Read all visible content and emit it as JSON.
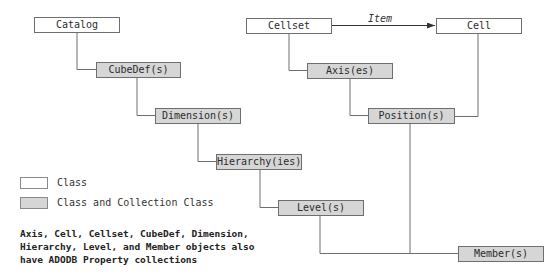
{
  "diagram": {
    "nodes": {
      "catalog": {
        "label": "Catalog",
        "kind": "class"
      },
      "cubedef": {
        "label": "CubeDef(s)",
        "kind": "collection"
      },
      "dimension": {
        "label": "Dimension(s)",
        "kind": "collection"
      },
      "hierarchy": {
        "label": "Hierarchy(ies)",
        "kind": "collection"
      },
      "level": {
        "label": "Level(s)",
        "kind": "collection"
      },
      "member": {
        "label": "Member(s)",
        "kind": "collection"
      },
      "cellset": {
        "label": "Cellset",
        "kind": "class"
      },
      "cell": {
        "label": "Cell",
        "kind": "class"
      },
      "axis": {
        "label": "Axis(es)",
        "kind": "collection"
      },
      "position": {
        "label": "Position(s)",
        "kind": "collection"
      }
    },
    "edges": [
      {
        "from": "catalog",
        "to": "cubedef"
      },
      {
        "from": "cubedef",
        "to": "dimension"
      },
      {
        "from": "dimension",
        "to": "hierarchy"
      },
      {
        "from": "hierarchy",
        "to": "level"
      },
      {
        "from": "level",
        "to": "member"
      },
      {
        "from": "cellset",
        "to": "axis"
      },
      {
        "from": "axis",
        "to": "position"
      },
      {
        "from": "position",
        "to": "member"
      },
      {
        "from": "cell",
        "to": "position"
      },
      {
        "from": "cellset",
        "to": "cell",
        "label": "Item",
        "arrow": true
      }
    ],
    "item_label": "Item",
    "colors": {
      "class_fill": "#ffffff",
      "collection_fill": "#d6d6d6",
      "border": "#6e6e6e",
      "line": "#6e6e6e"
    }
  },
  "legend": {
    "class_label": "Class",
    "collection_label": "Class and Collection Class"
  },
  "note": "Axis, Cell, Cellset, CubeDef, Dimension,\nHierarchy, Level, and Member objects also\nhave ADODB Property collections"
}
